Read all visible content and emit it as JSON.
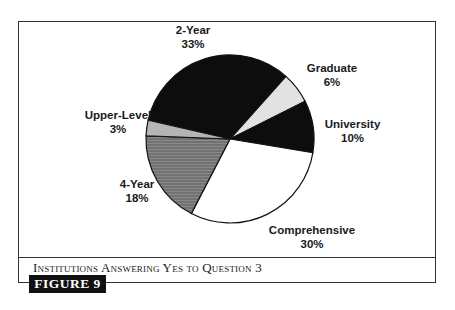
{
  "chart_data": {
    "type": "pie",
    "title": "Institutions Answering Yes to Question 3",
    "figure_label": "FIGURE 9",
    "categories": [
      "2-Year",
      "Graduate",
      "University",
      "Comprehensive",
      "4-Year",
      "Upper-Level"
    ],
    "values": [
      33,
      6,
      10,
      30,
      18,
      3
    ],
    "unit": "%",
    "colors": [
      "#0d0d0d",
      "#e2e2e2",
      "#0d0d0d",
      "#ffffff",
      "#7a7a7a",
      "#b5b5b5"
    ],
    "legend": "none (direct labels)"
  },
  "labels": {
    "two_year": {
      "name": "2-Year",
      "pct": "33%"
    },
    "graduate": {
      "name": "Graduate",
      "pct": "6%"
    },
    "university": {
      "name": "University",
      "pct": "10%"
    },
    "comprehensive": {
      "name": "Comprehensive",
      "pct": "30%"
    },
    "four_year": {
      "name": "4-Year",
      "pct": "18%"
    },
    "upper_level": {
      "name": "Upper-Level",
      "pct": "3%"
    }
  },
  "caption": "Institutions Answering Yes to Question 3",
  "figure_tab": "FIGURE 9"
}
